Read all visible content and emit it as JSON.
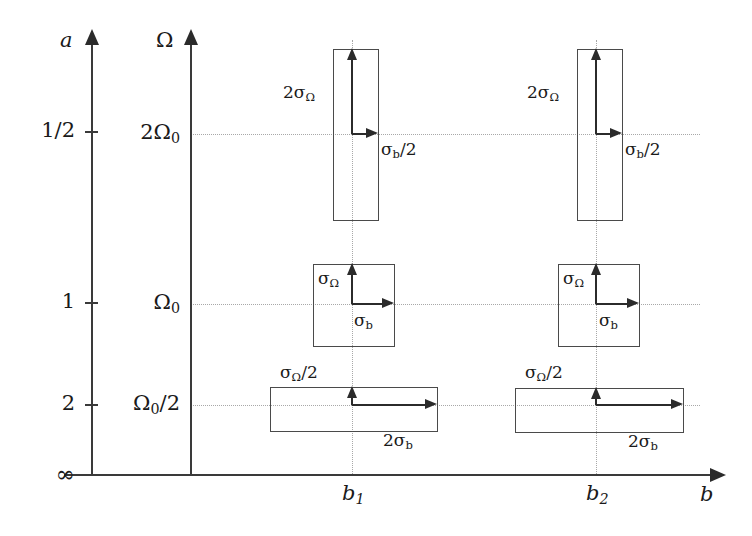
{
  "figure": {
    "axes": {
      "a_axis": {
        "name": "a",
        "x": 91,
        "top": 30,
        "bottom": 474
      },
      "omega_axis": {
        "name": "Ω",
        "x": 190,
        "top": 30,
        "bottom": 474
      },
      "b_axis": {
        "name": "b",
        "y": 474,
        "left": 91,
        "right": 726
      }
    },
    "a_ticks": [
      {
        "label": "1/2",
        "y": 131
      },
      {
        "label": "1",
        "y": 302
      },
      {
        "label": "2",
        "y": 404
      },
      {
        "label": "∞",
        "y": 474
      }
    ],
    "omega_ticks": [
      {
        "label": "2Ω",
        "sub": "0",
        "y": 134
      },
      {
        "label": "Ω",
        "sub": "0",
        "y": 304
      },
      {
        "label": "Ω",
        "sub": "0",
        "suffix": "/2",
        "y": 405
      }
    ],
    "b_ticks": [
      {
        "label": "b",
        "sub": "1",
        "x": 352
      },
      {
        "label": "b",
        "sub": "2",
        "x": 596
      }
    ],
    "gridlines": {
      "horizontal_y": [
        134,
        304,
        405
      ],
      "vertical_x": [
        352,
        596
      ],
      "h_left": 190,
      "h_right": 700,
      "v_top": 40,
      "v_bottom": 474
    },
    "error_boxes": [
      {
        "id": "b1-2omega0",
        "column": "b1",
        "row": "2Ω₀",
        "x": 333,
        "y": 49,
        "width": 44,
        "height": 170,
        "v_label": "2σ",
        "v_sub": "Ω",
        "h_label": "σ",
        "h_sub": "b",
        "h_suffix": "/2",
        "v_label_x": 283,
        "v_label_y": 84,
        "h_label_x": 381,
        "h_label_y": 141
      },
      {
        "id": "b1-omega0",
        "column": "b1",
        "row": "Ω₀",
        "x": 313,
        "y": 264,
        "width": 80,
        "height": 81,
        "v_label": "σ",
        "v_sub": "Ω",
        "v_suffix": "",
        "h_label": "σ",
        "h_sub": "b",
        "h_suffix": "",
        "v_label_x": 318,
        "v_label_y": 270,
        "h_label_x": 354,
        "h_label_y": 312
      },
      {
        "id": "b1-omega0-half",
        "column": "b1",
        "row": "Ω₀/2",
        "x": 270,
        "y": 387,
        "width": 166,
        "height": 43,
        "v_label": "σ",
        "v_sub": "Ω",
        "v_suffix": "/2",
        "h_label": "2σ",
        "h_sub": "b",
        "h_suffix": "",
        "v_label_x": 280,
        "v_label_y": 364,
        "h_label_x": 383,
        "h_label_y": 432
      },
      {
        "id": "b2-2omega0",
        "column": "b2",
        "row": "2Ω₀",
        "x": 577,
        "y": 49,
        "width": 44,
        "height": 170,
        "v_label": "2σ",
        "v_sub": "Ω",
        "h_label": "σ",
        "h_sub": "b",
        "h_suffix": "/2",
        "v_label_x": 527,
        "v_label_y": 84,
        "h_label_x": 625,
        "h_label_y": 141
      },
      {
        "id": "b2-omega0",
        "column": "b2",
        "row": "Ω₀",
        "x": 558,
        "y": 264,
        "width": 80,
        "height": 81,
        "v_label": "σ",
        "v_sub": "Ω",
        "v_suffix": "",
        "h_label": "σ",
        "h_sub": "b",
        "h_suffix": "",
        "v_label_x": 563,
        "v_label_y": 270,
        "h_label_x": 599,
        "h_label_y": 312
      },
      {
        "id": "b2-omega0-half",
        "column": "b2",
        "row": "Ω₀/2",
        "x": 515,
        "y": 388,
        "width": 167,
        "height": 43,
        "v_label": "σ",
        "v_sub": "Ω",
        "v_suffix": "/2",
        "h_label": "2σ",
        "h_sub": "b",
        "h_suffix": "",
        "v_label_x": 525,
        "v_label_y": 364,
        "h_label_x": 628,
        "h_label_y": 433
      }
    ]
  },
  "chart_data": {
    "type": "diagram",
    "title": "",
    "xlabel": "b",
    "ylabel": "Ω",
    "secondary_ylabel": "a",
    "x_tick_labels": [
      "b₁",
      "b₂"
    ],
    "y_tick_labels": [
      "2Ω₀",
      "Ω₀",
      "Ω₀/2"
    ],
    "secondary_y_tick_labels": [
      "1/2",
      "1",
      "2",
      "∞"
    ],
    "grid": true,
    "legend": "none",
    "boxes": [
      {
        "x": "b₁",
        "y": "2Ω₀",
        "a": "1/2",
        "width_label": "σ_b/2",
        "height_label": "2σ_Ω",
        "width_rel": 0.5,
        "height_rel": 2.0
      },
      {
        "x": "b₁",
        "y": "Ω₀",
        "a": "1",
        "width_label": "σ_b",
        "height_label": "σ_Ω",
        "width_rel": 1.0,
        "height_rel": 1.0
      },
      {
        "x": "b₁",
        "y": "Ω₀/2",
        "a": "2",
        "width_label": "2σ_b",
        "height_label": "σ_Ω/2",
        "width_rel": 2.0,
        "height_rel": 0.5
      },
      {
        "x": "b₂",
        "y": "2Ω₀",
        "a": "1/2",
        "width_label": "σ_b/2",
        "height_label": "2σ_Ω",
        "width_rel": 0.5,
        "height_rel": 2.0
      },
      {
        "x": "b₂",
        "y": "Ω₀",
        "a": "1",
        "width_label": "σ_b",
        "height_label": "σ_Ω",
        "width_rel": 1.0,
        "height_rel": 1.0
      },
      {
        "x": "b₂",
        "y": "Ω₀/2",
        "a": "2",
        "width_label": "2σ_b",
        "height_label": "σ_Ω/2",
        "width_rel": 2.0,
        "height_rel": 0.5
      }
    ],
    "note": "Box area is constant: widening in b narrows in Ω (time–frequency uncertainty)."
  },
  "colors": {
    "line": "#3a3a3a",
    "grid": "#a8a8a8",
    "box": "#4a4a4a",
    "text": "#1a1a1a",
    "background": "#ffffff"
  }
}
